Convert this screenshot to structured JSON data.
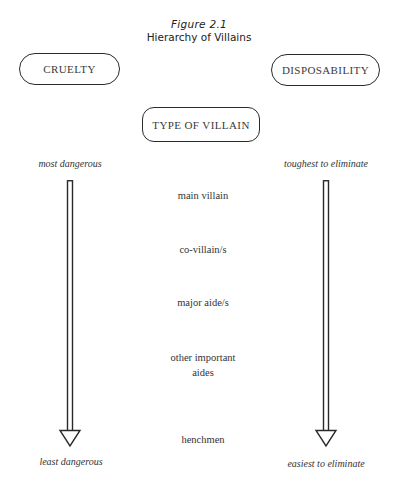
{
  "figure": {
    "number": "Figure 2.1",
    "title": "Hierarchy of Villains"
  },
  "headers": {
    "left": "CRUELTY",
    "right": "DISPOSABILITY",
    "center": "TYPE OF VILLAIN"
  },
  "axes": {
    "left": {
      "top_label": "most dangerous",
      "bottom_label": "least dangerous",
      "direction": "down"
    },
    "right": {
      "top_label": "toughest to eliminate",
      "bottom_label": "easiest to eliminate",
      "direction": "down"
    }
  },
  "villain_types": [
    {
      "label": "main villain"
    },
    {
      "label": "co-villain/s"
    },
    {
      "label": "major aide/s"
    },
    {
      "label": "other important aides"
    },
    {
      "label": "henchmen"
    }
  ],
  "villain_types_display": {
    "other_line1": "other important",
    "other_line2": "aides"
  },
  "colors": {
    "ink": "#2a2a2a",
    "background": "#ffffff"
  }
}
